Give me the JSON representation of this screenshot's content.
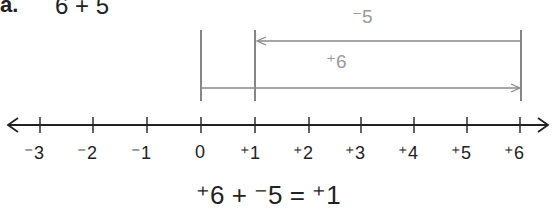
{
  "problem": {
    "label": "a.",
    "expression_top": "6 + 5",
    "equation": "⁺6 + ⁻5 = ⁺1"
  },
  "number_line": {
    "min": -3,
    "max": 6,
    "ticks": [
      {
        "value": -3,
        "label": "⁻3",
        "x": 40
      },
      {
        "value": -2,
        "label": "⁻2",
        "x": 93
      },
      {
        "value": -1,
        "label": "⁻1",
        "x": 147
      },
      {
        "value": 0,
        "label": "0",
        "x": 201
      },
      {
        "value": 1,
        "label": "⁺1",
        "x": 255
      },
      {
        "value": 2,
        "label": "⁺2",
        "x": 309
      },
      {
        "value": 3,
        "label": "⁺3",
        "x": 361
      },
      {
        "value": 4,
        "label": "⁺4",
        "x": 414
      },
      {
        "value": 5,
        "label": "⁺5",
        "x": 467
      },
      {
        "value": 6,
        "label": "⁺6",
        "x": 520
      }
    ]
  },
  "arrows": [
    {
      "name": "positive-six-arrow",
      "label": "⁺6",
      "from": 0,
      "to": 6,
      "color": "#888888"
    },
    {
      "name": "negative-five-arrow",
      "label": "⁻5",
      "from": 6,
      "to": 1,
      "color": "#888888"
    }
  ],
  "colors": {
    "axis": "#222222",
    "arrow": "#888888",
    "text": "#222222",
    "arrow_text": "#999999"
  }
}
